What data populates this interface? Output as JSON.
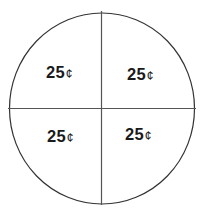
{
  "diagram": {
    "shape": "circle divided into four equal quadrants",
    "stroke_color": "#333333",
    "quadrants": [
      {
        "position": "top-left",
        "value": "25",
        "unit": "¢"
      },
      {
        "position": "top-right",
        "value": "25",
        "unit": "¢"
      },
      {
        "position": "bottom-left",
        "value": "25",
        "unit": "¢"
      },
      {
        "position": "bottom-right",
        "value": "25",
        "unit": "¢"
      }
    ]
  }
}
